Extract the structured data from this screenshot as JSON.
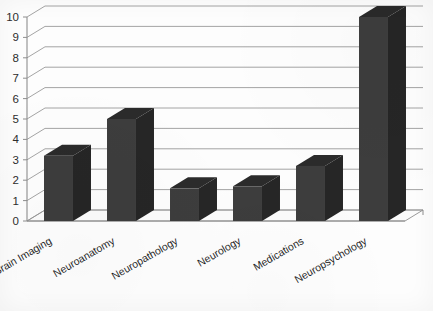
{
  "chart_data": {
    "type": "bar",
    "title": "",
    "subtitle": "",
    "xlabel": "",
    "ylabel": "",
    "categories": [
      "Brain Imaging",
      "Neuroanatomy",
      "Neuropathology",
      "Neurology",
      "Medications",
      "Neuropsychology"
    ],
    "values": [
      3.2,
      5.0,
      1.6,
      1.7,
      2.7,
      10.0
    ],
    "ylim": [
      0,
      10
    ],
    "ytick_labels": [
      "0",
      "1",
      "2",
      "3",
      "4",
      "5",
      "6",
      "7",
      "8",
      "9",
      "10"
    ],
    "ytick_values": [
      0,
      1,
      2,
      3,
      4,
      5,
      6,
      7,
      8,
      9,
      10
    ],
    "grid": true,
    "grid_axis": "y",
    "legend": false,
    "legend_position": "none",
    "style": "3d-column",
    "category_label_rotation_deg": -30,
    "colors": {
      "bar_front": "#3d3d3d",
      "bar_side": "#262626",
      "bar_top": "#2b2b2b",
      "gridline": "#9a9a9a",
      "axis": "#8e8e8e",
      "plot_background": "#fdfdfd",
      "tick_text": "#2e2e2e",
      "category_text": "#1f1f1f"
    }
  }
}
